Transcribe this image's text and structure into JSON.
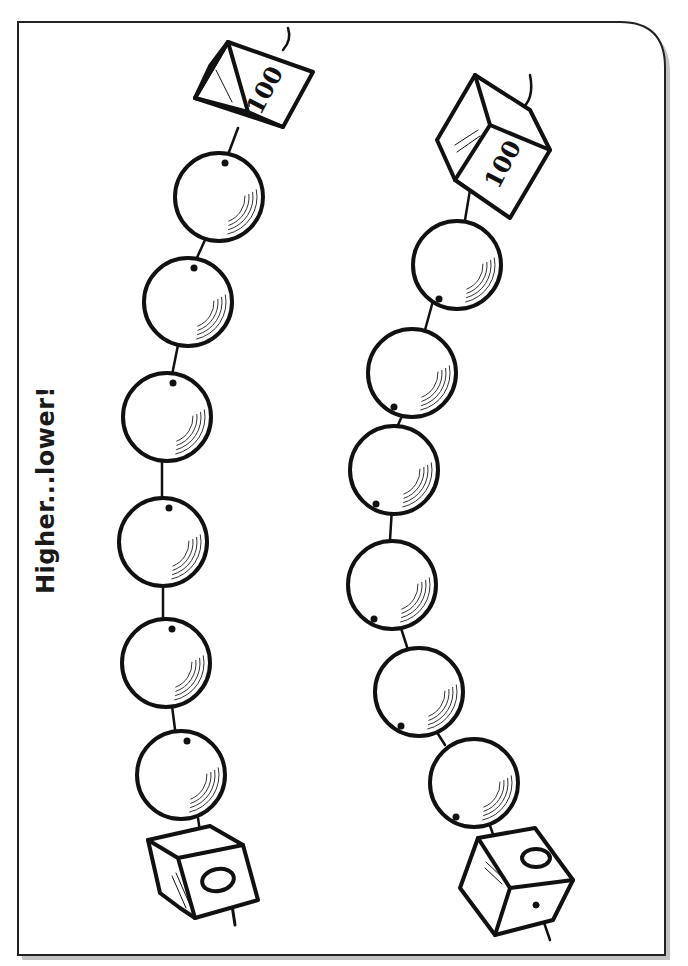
{
  "worksheet": {
    "title": "Higher...lower!",
    "colors": {
      "ink": "#111111",
      "paper": "#ffffff",
      "frame_shadow": "#777777"
    }
  },
  "strings": [
    {
      "name": "left",
      "top_cube_label": "100",
      "bottom_cube_label": "0",
      "beads": [
        {
          "cx": 219,
          "cy": 197,
          "value": ""
        },
        {
          "cx": 188,
          "cy": 302,
          "value": ""
        },
        {
          "cx": 167,
          "cy": 417,
          "value": ""
        },
        {
          "cx": 163,
          "cy": 542,
          "value": ""
        },
        {
          "cx": 166,
          "cy": 663,
          "value": ""
        },
        {
          "cx": 181,
          "cy": 775,
          "value": ""
        }
      ]
    },
    {
      "name": "right",
      "top_cube_label": "100",
      "bottom_cube_label": "0",
      "beads": [
        {
          "cx": 457,
          "cy": 265,
          "value": ""
        },
        {
          "cx": 412,
          "cy": 373,
          "value": ""
        },
        {
          "cx": 394,
          "cy": 470,
          "value": ""
        },
        {
          "cx": 392,
          "cy": 585,
          "value": ""
        },
        {
          "cx": 419,
          "cy": 692,
          "value": ""
        },
        {
          "cx": 474,
          "cy": 783,
          "value": ""
        }
      ]
    }
  ]
}
